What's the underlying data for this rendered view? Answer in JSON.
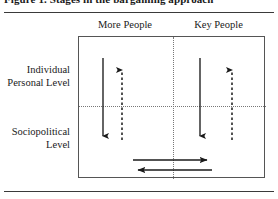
{
  "figure": {
    "title": "Figure 1. Stages in the bargaining approach",
    "columns": [
      {
        "key": "more-people",
        "label": "More People"
      },
      {
        "key": "key-people",
        "label": "Key People"
      }
    ],
    "rows": [
      {
        "key": "individual-personal-level",
        "label": "Individual\nPersonal Level"
      },
      {
        "key": "sociopolitical-level",
        "label": "Sociopolitical\nLevel"
      }
    ],
    "row_labels": {
      "upper_line1": "Individual",
      "upper_line2": "Personal Level",
      "lower_line1": "Sociopolitical",
      "lower_line2": "Level"
    },
    "colors": {
      "ink": "#1a1a1a",
      "box_border": "#555555",
      "divider": "#777777",
      "rule": "#3a3a3a",
      "arrow": "#1a1a1a",
      "background": "#ffffff"
    },
    "arrows": [
      {
        "name": "more-people-downward-solid",
        "column": "more-people",
        "direction": "down",
        "style": "solid",
        "x": 103,
        "y1": 58,
        "y2": 138
      },
      {
        "name": "more-people-upward-dashed",
        "column": "more-people",
        "direction": "up",
        "style": "dashed",
        "x": 122,
        "y1": 140,
        "y2": 66
      },
      {
        "name": "key-people-downward-solid",
        "column": "key-people",
        "direction": "down",
        "style": "solid",
        "x": 200,
        "y1": 58,
        "y2": 138
      },
      {
        "name": "key-people-upward-dashed",
        "column": "key-people",
        "direction": "up",
        "style": "dashed",
        "x": 232,
        "y1": 140,
        "y2": 66
      },
      {
        "name": "sociopolitical-rightward",
        "column": "both",
        "direction": "right",
        "style": "solid",
        "y": 160,
        "x1": 133,
        "x2": 212
      },
      {
        "name": "sociopolitical-leftward",
        "column": "both",
        "direction": "left",
        "style": "solid",
        "y": 170,
        "x1": 212,
        "x2": 133
      }
    ]
  }
}
